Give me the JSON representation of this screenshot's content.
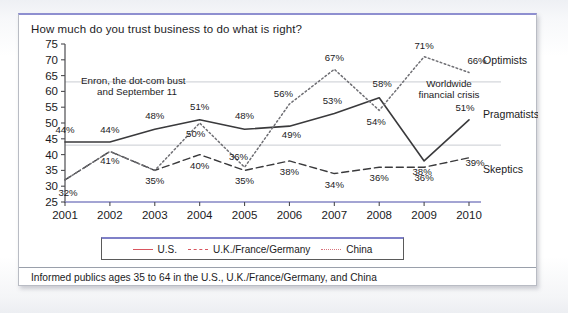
{
  "figure": {
    "title": "How much do you trust business to do what is right?",
    "footnote": "Informed publics ages 35 to 64 in the U.S., U.K./France/Germany, and China",
    "frame_accent_color": "#8e8fd0"
  },
  "legend": {
    "items": [
      {
        "label": "U.S.",
        "style": "solid",
        "color": "#d9555f",
        "icon": "line-solid-icon"
      },
      {
        "label": "U.K./France/Germany",
        "style": "dashed",
        "color": "#d9555f",
        "icon": "line-dashed-icon"
      },
      {
        "label": "China",
        "style": "dotted",
        "color": "#d9737b",
        "icon": "line-dotted-icon"
      }
    ]
  },
  "series_labels": [
    {
      "name": "Optimists",
      "y_value": 70
    },
    {
      "name": "Pragmatists",
      "y_value": 53
    },
    {
      "name": "Skeptics",
      "y_value": 35.5
    }
  ],
  "annotations": [
    {
      "id": "enron",
      "lines": [
        "Enron, the dot-com bust",
        "and September 11"
      ]
    },
    {
      "id": "crisis",
      "lines": [
        "Worldwide",
        "financial crisis"
      ]
    }
  ],
  "chart_data": {
    "type": "line",
    "title": "How much do you trust business to do what is right?",
    "xlabel": "",
    "ylabel": "",
    "x": [
      2001,
      2002,
      2003,
      2004,
      2005,
      2006,
      2007,
      2008,
      2009,
      2010
    ],
    "categories": [
      "2001",
      "2002",
      "2003",
      "2004",
      "2005",
      "2006",
      "2007",
      "2008",
      "2009",
      "2010"
    ],
    "ylim": [
      25,
      75
    ],
    "yticks": [
      25,
      30,
      35,
      40,
      45,
      50,
      55,
      60,
      65,
      70,
      75
    ],
    "gridlines": [
      43,
      63
    ],
    "grid": true,
    "legend_position": "bottom",
    "series": [
      {
        "name": "U.S.",
        "group": "Pragmatists",
        "style": "solid",
        "color": "#3a3a3c",
        "values": [
          44,
          44,
          48,
          51,
          48,
          49,
          53,
          58,
          38,
          51
        ],
        "labels": [
          "44%",
          "44%",
          "48%",
          "51%",
          "48%",
          "49%",
          "53%",
          "58%",
          "38%",
          "51%"
        ]
      },
      {
        "name": "U.K./France/Germany",
        "group": "Skeptics",
        "style": "dashed",
        "color": "#3a3a3c",
        "values": [
          32,
          41,
          35,
          40,
          35,
          38,
          34,
          36,
          36,
          39
        ],
        "labels": [
          "32%",
          "41%",
          "35%",
          "40%",
          "35%",
          "38%",
          "34%",
          "36%",
          "36%",
          "39%"
        ]
      },
      {
        "name": "China",
        "group": "Optimists",
        "style": "dotted",
        "color": "#6f6f74",
        "values": [
          32,
          41,
          35,
          50,
          36,
          56,
          67,
          54,
          71,
          66
        ],
        "labels": [
          "",
          "",
          "",
          "50%",
          "36%",
          "56%",
          "67%",
          "54%",
          "71%",
          "66%"
        ]
      }
    ],
    "annotations": [
      {
        "text": "Enron, the dot-com bust and September 11",
        "x": 2001.6,
        "y": 60
      },
      {
        "text": "Worldwide financial crisis",
        "x": 2008.7,
        "y": 59
      }
    ]
  }
}
